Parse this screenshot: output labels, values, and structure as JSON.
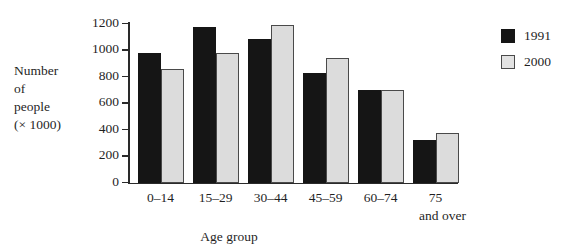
{
  "chart_data": {
    "type": "bar",
    "title": "",
    "subtitle": "",
    "xlabel": "Age group",
    "ylabel": "Number of people (× 1000)",
    "ylabel_lines": [
      "Number",
      "of",
      "people",
      "(× 1000)"
    ],
    "categories": [
      "0–14",
      "15–29",
      "30–44",
      "45–59",
      "60–74",
      "75 and over"
    ],
    "category_labels": [
      {
        "line1": "0–14",
        "line2": ""
      },
      {
        "line1": "15–29",
        "line2": ""
      },
      {
        "line1": "30–44",
        "line2": ""
      },
      {
        "line1": "45–59",
        "line2": ""
      },
      {
        "line1": "60–74",
        "line2": ""
      },
      {
        "line1": "75",
        "line2": "and over"
      }
    ],
    "series": [
      {
        "name": "1991",
        "color": "#151515",
        "values": [
          975,
          1170,
          1085,
          830,
          700,
          320
        ]
      },
      {
        "name": "2000",
        "color": "#dcdcdc",
        "values": [
          855,
          980,
          1190,
          940,
          695,
          370
        ]
      }
    ],
    "ylim": [
      0,
      1200
    ],
    "ytick_values": [
      0,
      200,
      400,
      600,
      800,
      1000,
      1200
    ],
    "ytick_labels": [
      "0",
      "200",
      "400",
      "600",
      "800",
      "1000",
      "1200"
    ],
    "grid": false,
    "legend": {
      "position": "right",
      "entries": [
        {
          "label": "1991",
          "swatch": "solid-dark"
        },
        {
          "label": "2000",
          "swatch": "outlined-light"
        }
      ]
    },
    "colors": {
      "series_1991": "#151515",
      "series_2000": "#dcdcdc",
      "series_2000_border": "#4a4a4a",
      "axis": "#2a2a2a",
      "text": "#1f1f1f",
      "background": "#ffffff"
    }
  }
}
